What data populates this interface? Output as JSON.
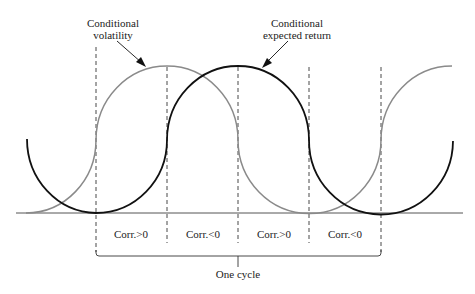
{
  "diagram": {
    "labels": {
      "volatility": [
        "Conditional",
        "volatility"
      ],
      "expected_return": [
        "Conditional",
        "expected return"
      ],
      "one_cycle": "One cycle"
    },
    "regions": [
      {
        "label": "Corr.>0"
      },
      {
        "label": "Corr.<0"
      },
      {
        "label": "Corr.>0"
      },
      {
        "label": "Corr.<0"
      }
    ],
    "colors": {
      "volatility_curve": "#8a8a8a",
      "expected_return_curve": "#111111",
      "baseline": "#555555",
      "dashed": "#333333"
    }
  }
}
